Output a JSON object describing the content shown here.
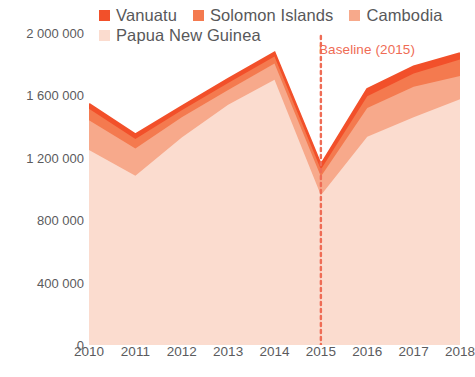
{
  "legend": {
    "items": [
      {
        "label": "Vanuatu",
        "color": "#f2502a",
        "name": "legend-item-vanuatu"
      },
      {
        "label": "Solomon Islands",
        "color": "#f47a4f",
        "name": "legend-item-solomon-islands"
      },
      {
        "label": "Cambodia",
        "color": "#f7a98b",
        "name": "legend-item-cambodia"
      },
      {
        "label": "Papua New Guinea",
        "color": "#fbdccf",
        "name": "legend-item-papua-new-guinea"
      }
    ]
  },
  "annotations": {
    "baseline": {
      "label": "Baseline (2015)",
      "year": 2015,
      "color": "#ef6c55"
    }
  },
  "axes": {
    "y_ticks": [
      "2 000 000",
      "1 600 000",
      "1 200 000",
      "800 000",
      "400 000",
      "0"
    ],
    "y_tick_values": [
      2000000,
      1600000,
      1200000,
      800000,
      400000,
      0
    ],
    "x_ticks": [
      "2010",
      "2011",
      "2012",
      "2013",
      "2014",
      "2015",
      "2016",
      "2017",
      "2018"
    ]
  },
  "chart_data": {
    "type": "area",
    "title": "",
    "subtitle": "",
    "xlabel": "",
    "ylabel": "",
    "stacked": true,
    "grid": false,
    "legend_position": "top",
    "ylim": [
      0,
      2000000
    ],
    "categories": [
      2010,
      2011,
      2012,
      2013,
      2014,
      2015,
      2016,
      2017,
      2018
    ],
    "series": [
      {
        "name": "Papua New Guinea",
        "color": "#fbdccf",
        "values": [
          1250000,
          1085000,
          1330000,
          1540000,
          1700000,
          960000,
          1335000,
          1460000,
          1575000
        ]
      },
      {
        "name": "Cambodia",
        "color": "#f7a98b",
        "values": [
          190000,
          175000,
          130000,
          95000,
          105000,
          120000,
          185000,
          195000,
          150000
        ]
      },
      {
        "name": "Solomon Islands",
        "color": "#f47a4f",
        "values": [
          75000,
          60000,
          45000,
          45000,
          45000,
          45000,
          75000,
          85000,
          105000
        ]
      },
      {
        "name": "Vanuatu",
        "color": "#f2502a",
        "values": [
          30000,
          30000,
          25000,
          25000,
          25000,
          30000,
          45000,
          45000,
          40000
        ]
      }
    ],
    "totals": [
      1545000,
      1350000,
      1530000,
      1705000,
      1875000,
      1155000,
      1640000,
      1785000,
      1870000
    ]
  }
}
